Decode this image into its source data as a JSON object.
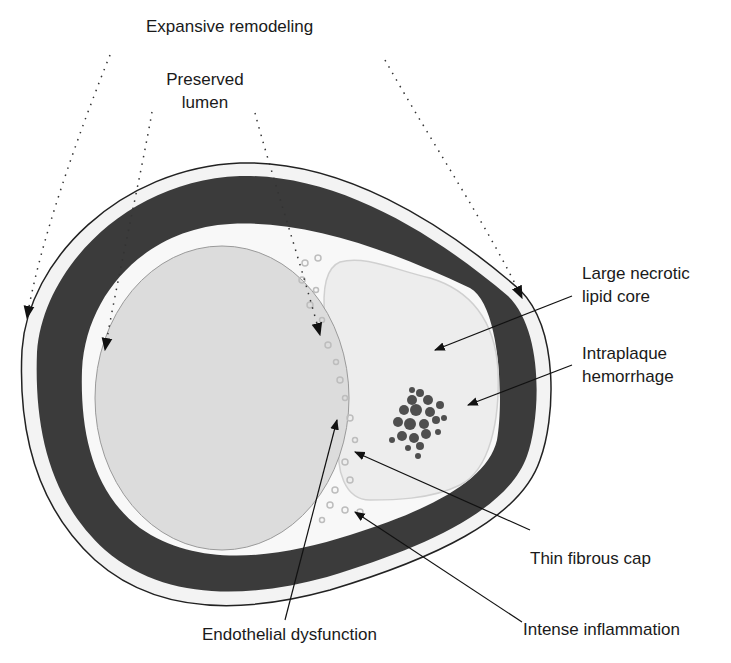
{
  "diagram": {
    "labels": {
      "expansive_remodeling": "Expansive remodeling",
      "preserved_lumen_line1": "Preserved",
      "preserved_lumen_line2": "lumen",
      "necrotic_core_line1": "Large necrotic",
      "necrotic_core_line2": "lipid core",
      "hemorrhage_line1": "Intraplaque",
      "hemorrhage_line2": "hemorrhage",
      "fibrous_cap": "Thin fibrous cap",
      "endothelial": "Endothelial dysfunction",
      "inflammation": "Intense inflammation"
    },
    "colors": {
      "media": "#3a3a3a",
      "adventitia": "#f2f2f2",
      "intima": "#f7f7f7",
      "lumen": "#dcdcdc",
      "lipid_core": "#ececec",
      "hemorrhage": "#4a4a4a",
      "outline": "#222222"
    }
  }
}
